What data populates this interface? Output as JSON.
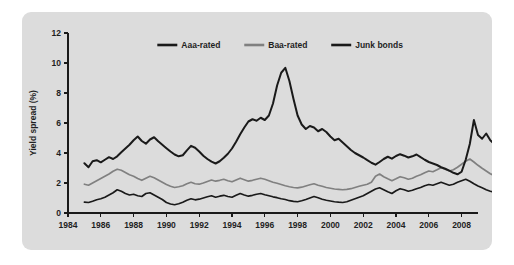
{
  "figure": {
    "panel_background": "#dcdcdc",
    "page_background": "#ffffff"
  },
  "chart_data": {
    "type": "line",
    "title": "",
    "subtitle": "",
    "xlabel": "",
    "ylabel": "Yield spread (%)",
    "xlim": [
      1984,
      2009
    ],
    "ylim": [
      0,
      12
    ],
    "xticks": [
      1984,
      1986,
      1988,
      1990,
      1992,
      1994,
      1996,
      1998,
      2000,
      2002,
      2004,
      2006,
      2008
    ],
    "xtick_labels": [
      "1984",
      "1986",
      "1988",
      "1990",
      "1992",
      "1994",
      "1996",
      "1998",
      "2000",
      "2002",
      "2004",
      "2006",
      "2008"
    ],
    "yticks": [
      0,
      2,
      4,
      6,
      8,
      10,
      12
    ],
    "ytick_labels": [
      "0",
      "2",
      "4",
      "6",
      "8",
      "10",
      "12"
    ],
    "grid": false,
    "legend_position": "top-center",
    "x_start": 1985.0,
    "x_step": 0.25,
    "series": [
      {
        "name": "Aaa-rated",
        "color": "#1a1a1a",
        "width": 1.7,
        "values": [
          0.72,
          0.7,
          0.78,
          0.88,
          0.95,
          1.05,
          1.2,
          1.35,
          1.55,
          1.45,
          1.3,
          1.2,
          1.25,
          1.15,
          1.1,
          1.3,
          1.35,
          1.2,
          1.05,
          0.9,
          0.7,
          0.6,
          0.55,
          0.62,
          0.72,
          0.85,
          0.95,
          0.88,
          0.92,
          1.0,
          1.08,
          1.15,
          1.05,
          1.12,
          1.18,
          1.1,
          1.05,
          1.18,
          1.3,
          1.2,
          1.12,
          1.18,
          1.25,
          1.3,
          1.22,
          1.15,
          1.08,
          1.02,
          0.95,
          0.9,
          0.82,
          0.78,
          0.75,
          0.82,
          0.9,
          1.0,
          1.1,
          1.02,
          0.92,
          0.85,
          0.8,
          0.75,
          0.72,
          0.7,
          0.75,
          0.85,
          0.95,
          1.05,
          1.15,
          1.3,
          1.45,
          1.6,
          1.68,
          1.55,
          1.42,
          1.3,
          1.48,
          1.62,
          1.55,
          1.45,
          1.52,
          1.62,
          1.7,
          1.82,
          1.9,
          1.85,
          1.95,
          2.05,
          1.95,
          1.85,
          1.92,
          2.05,
          2.15,
          2.25,
          2.12,
          1.95,
          1.8,
          1.68,
          1.55,
          1.45,
          1.38,
          1.3,
          1.42,
          1.55,
          1.48,
          1.38,
          1.3,
          1.22,
          1.15,
          1.08,
          1.02,
          0.95,
          0.88,
          0.82,
          0.78,
          0.72,
          0.68,
          0.62,
          0.58,
          0.55,
          0.62,
          0.78,
          0.95,
          1.2,
          1.5,
          1.88
        ]
      },
      {
        "name": "Baa-rated",
        "color": "#808080",
        "width": 1.7,
        "values": [
          1.92,
          1.85,
          2.0,
          2.15,
          2.3,
          2.45,
          2.6,
          2.78,
          2.92,
          2.85,
          2.7,
          2.55,
          2.45,
          2.3,
          2.18,
          2.32,
          2.45,
          2.35,
          2.2,
          2.05,
          1.9,
          1.78,
          1.7,
          1.75,
          1.82,
          1.95,
          2.05,
          1.95,
          1.92,
          2.0,
          2.1,
          2.2,
          2.12,
          2.18,
          2.25,
          2.15,
          2.08,
          2.2,
          2.32,
          2.22,
          2.12,
          2.18,
          2.25,
          2.32,
          2.25,
          2.15,
          2.05,
          1.98,
          1.9,
          1.82,
          1.75,
          1.7,
          1.68,
          1.72,
          1.8,
          1.88,
          1.95,
          1.85,
          1.78,
          1.7,
          1.65,
          1.6,
          1.58,
          1.55,
          1.58,
          1.62,
          1.7,
          1.78,
          1.85,
          1.92,
          2.05,
          2.45,
          2.6,
          2.42,
          2.28,
          2.15,
          2.28,
          2.42,
          2.35,
          2.25,
          2.32,
          2.45,
          2.55,
          2.68,
          2.8,
          2.75,
          2.88,
          3.02,
          2.92,
          2.8,
          2.88,
          3.05,
          3.25,
          3.45,
          3.6,
          3.4,
          3.18,
          2.98,
          2.8,
          2.62,
          2.48,
          2.35,
          2.45,
          2.55,
          2.42,
          2.28,
          2.15,
          2.05,
          1.95,
          1.88,
          1.92,
          1.85,
          1.78,
          1.75,
          1.7,
          1.65,
          1.62,
          1.58,
          1.62,
          1.6,
          1.7,
          1.88,
          2.1,
          2.45,
          2.85,
          3.3
        ]
      },
      {
        "name": "Junk bonds",
        "color": "#1a1a1a",
        "width": 2.0,
        "values": [
          3.32,
          3.05,
          3.45,
          3.52,
          3.38,
          3.55,
          3.72,
          3.6,
          3.78,
          4.05,
          4.3,
          4.55,
          4.85,
          5.1,
          4.8,
          4.62,
          4.9,
          5.05,
          4.78,
          4.55,
          4.32,
          4.1,
          3.9,
          3.78,
          3.85,
          4.18,
          4.48,
          4.35,
          4.1,
          3.82,
          3.6,
          3.42,
          3.3,
          3.45,
          3.68,
          3.95,
          4.3,
          4.75,
          5.25,
          5.7,
          6.1,
          6.25,
          6.15,
          6.35,
          6.2,
          6.5,
          7.3,
          8.5,
          9.35,
          9.68,
          8.8,
          7.6,
          6.5,
          5.9,
          5.6,
          5.8,
          5.7,
          5.45,
          5.6,
          5.4,
          5.1,
          4.85,
          4.95,
          4.7,
          4.45,
          4.2,
          4.0,
          3.85,
          3.7,
          3.52,
          3.35,
          3.22,
          3.4,
          3.6,
          3.75,
          3.62,
          3.8,
          3.92,
          3.82,
          3.7,
          3.78,
          3.9,
          3.72,
          3.55,
          3.4,
          3.3,
          3.2,
          3.05,
          2.95,
          2.82,
          2.68,
          2.58,
          2.75,
          3.55,
          4.6,
          6.2,
          5.2,
          4.95,
          5.3,
          4.85,
          4.6,
          5.05,
          4.9,
          4.65,
          4.95,
          5.5,
          6.2,
          6.9,
          7.6,
          8.55,
          8.1,
          7.8,
          8.25,
          7.7,
          7.95,
          9.05,
          8.1,
          6.5,
          5.85,
          6.6,
          7.6,
          8.8,
          9.7,
          9.2,
          8.3,
          7.2,
          6.2,
          5.4,
          4.8,
          4.55,
          4.25,
          4.05,
          3.9,
          3.82,
          3.7,
          3.95,
          4.15,
          3.95,
          3.75,
          3.58,
          3.72,
          4.0,
          4.25,
          4.1,
          3.88,
          3.7,
          3.55,
          3.42,
          3.35,
          3.25,
          3.15,
          3.05,
          2.95,
          2.82,
          3.15,
          3.6,
          4.3,
          5.2,
          6.4,
          7.35
        ]
      }
    ]
  },
  "legend": {
    "entries": [
      {
        "label": "Aaa-rated",
        "color": "#1a1a1a"
      },
      {
        "label": "Baa-rated",
        "color": "#808080"
      },
      {
        "label": "Junk bonds",
        "color": "#1a1a1a"
      }
    ]
  }
}
